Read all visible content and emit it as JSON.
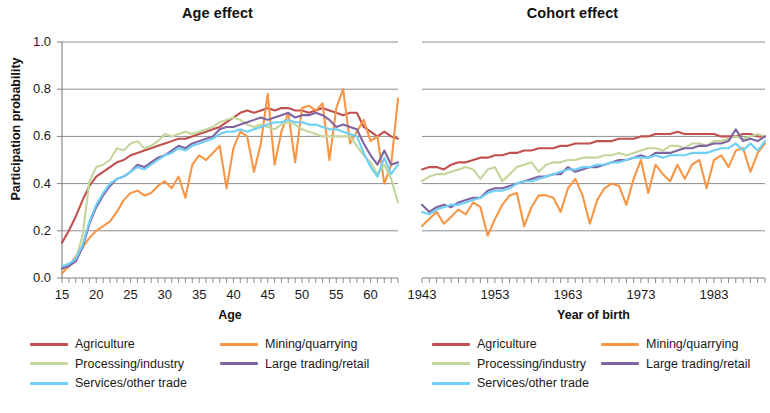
{
  "figure": {
    "panels": [
      "Age effect",
      "Cohort effect"
    ],
    "y_axis_label": "Participation probability"
  },
  "series_colors": {
    "Agriculture": "#c0504d",
    "Mining/quarrying": "#f79646",
    "Processing/industry": "#c3d69b",
    "Large trading/retail": "#8064a2",
    "Services/other trade": "#6ecff6"
  },
  "legend": {
    "items": [
      {
        "label": "Agriculture",
        "color": "#c0504d"
      },
      {
        "label": "Mining/quarrying",
        "color": "#f79646"
      },
      {
        "label": "Processing/industry",
        "color": "#c3d69b"
      },
      {
        "label": "Large trading/retail",
        "color": "#8064a2"
      },
      {
        "label": "Services/other trade",
        "color": "#6ecff6"
      }
    ]
  },
  "chart_data": [
    {
      "type": "line",
      "title": "Age effect",
      "xlabel": "Age",
      "ylabel": "Participation probability",
      "xlim": [
        15,
        64
      ],
      "ylim": [
        0.0,
        1.0
      ],
      "xticks": [
        15,
        20,
        25,
        30,
        35,
        40,
        45,
        50,
        55,
        60
      ],
      "yticks": [
        0.0,
        0.2,
        0.4,
        0.6,
        0.8,
        1.0
      ],
      "grid": "horizontal",
      "legend_position": "below",
      "x": [
        15,
        16,
        17,
        18,
        19,
        20,
        21,
        22,
        23,
        24,
        25,
        26,
        27,
        28,
        29,
        30,
        31,
        32,
        33,
        34,
        35,
        36,
        37,
        38,
        39,
        40,
        41,
        42,
        43,
        44,
        45,
        46,
        47,
        48,
        49,
        50,
        51,
        52,
        53,
        54,
        55,
        56,
        57,
        58,
        59,
        60,
        61,
        62,
        63,
        64
      ],
      "series": [
        {
          "name": "Agriculture",
          "color": "#c0504d",
          "values": [
            0.15,
            0.2,
            0.26,
            0.33,
            0.39,
            0.43,
            0.45,
            0.47,
            0.49,
            0.5,
            0.52,
            0.53,
            0.54,
            0.55,
            0.56,
            0.57,
            0.58,
            0.59,
            0.59,
            0.6,
            0.61,
            0.62,
            0.63,
            0.64,
            0.66,
            0.68,
            0.7,
            0.71,
            0.7,
            0.71,
            0.72,
            0.71,
            0.72,
            0.72,
            0.71,
            0.71,
            0.7,
            0.71,
            0.72,
            0.71,
            0.7,
            0.69,
            0.7,
            0.7,
            0.64,
            0.62,
            0.6,
            0.62,
            0.6,
            0.59
          ]
        },
        {
          "name": "Mining/quarrying",
          "color": "#f79646",
          "values": [
            0.02,
            0.05,
            0.09,
            0.13,
            0.17,
            0.2,
            0.22,
            0.24,
            0.28,
            0.33,
            0.36,
            0.37,
            0.35,
            0.36,
            0.39,
            0.41,
            0.38,
            0.43,
            0.34,
            0.48,
            0.52,
            0.5,
            0.53,
            0.56,
            0.38,
            0.55,
            0.62,
            0.6,
            0.45,
            0.57,
            0.78,
            0.48,
            0.62,
            0.7,
            0.49,
            0.72,
            0.73,
            0.71,
            0.74,
            0.5,
            0.72,
            0.8,
            0.57,
            0.62,
            0.67,
            0.58,
            0.6,
            0.4,
            0.48,
            0.76
          ]
        },
        {
          "name": "Processing/industry",
          "color": "#c3d69b",
          "values": [
            0.04,
            0.05,
            0.08,
            0.18,
            0.41,
            0.47,
            0.48,
            0.5,
            0.55,
            0.54,
            0.57,
            0.58,
            0.55,
            0.56,
            0.58,
            0.61,
            0.6,
            0.61,
            0.62,
            0.61,
            0.62,
            0.63,
            0.64,
            0.66,
            0.67,
            0.68,
            0.67,
            0.65,
            0.64,
            0.65,
            0.64,
            0.63,
            0.65,
            0.66,
            0.65,
            0.63,
            0.62,
            0.61,
            0.6,
            0.6,
            0.6,
            0.6,
            0.6,
            0.56,
            0.52,
            0.49,
            0.44,
            0.48,
            0.42,
            0.32
          ]
        },
        {
          "name": "Large trading/retail",
          "color": "#8064a2",
          "values": [
            0.04,
            0.05,
            0.07,
            0.13,
            0.23,
            0.3,
            0.35,
            0.39,
            0.42,
            0.43,
            0.45,
            0.48,
            0.47,
            0.49,
            0.51,
            0.52,
            0.54,
            0.56,
            0.55,
            0.57,
            0.58,
            0.59,
            0.6,
            0.63,
            0.64,
            0.64,
            0.65,
            0.66,
            0.67,
            0.68,
            0.67,
            0.68,
            0.69,
            0.7,
            0.68,
            0.69,
            0.69,
            0.7,
            0.69,
            0.67,
            0.64,
            0.65,
            0.64,
            0.63,
            0.57,
            0.52,
            0.48,
            0.54,
            0.48,
            0.49
          ]
        },
        {
          "name": "Services/other trade",
          "color": "#6ecff6",
          "values": [
            0.05,
            0.06,
            0.08,
            0.14,
            0.24,
            0.31,
            0.36,
            0.4,
            0.42,
            0.43,
            0.45,
            0.47,
            0.46,
            0.48,
            0.5,
            0.52,
            0.53,
            0.55,
            0.54,
            0.56,
            0.57,
            0.58,
            0.59,
            0.61,
            0.62,
            0.62,
            0.63,
            0.62,
            0.63,
            0.64,
            0.65,
            0.66,
            0.66,
            0.67,
            0.66,
            0.66,
            0.65,
            0.65,
            0.64,
            0.63,
            0.63,
            0.62,
            0.61,
            0.6,
            0.53,
            0.47,
            0.43,
            0.51,
            0.44,
            0.48
          ]
        }
      ]
    },
    {
      "type": "line",
      "title": "Cohort effect",
      "xlabel": "Year of birth",
      "ylabel": "Participation probability",
      "xlim": [
        1943,
        1990
      ],
      "ylim": [
        0.0,
        1.0
      ],
      "xticks": [
        1943,
        1953,
        1963,
        1973,
        1983
      ],
      "yticks": [
        0.0,
        0.2,
        0.4,
        0.6,
        0.8,
        1.0
      ],
      "grid": "horizontal",
      "legend_position": "below",
      "x": [
        1943,
        1944,
        1945,
        1946,
        1947,
        1948,
        1949,
        1950,
        1951,
        1952,
        1953,
        1954,
        1955,
        1956,
        1957,
        1958,
        1959,
        1960,
        1961,
        1962,
        1963,
        1964,
        1965,
        1966,
        1967,
        1968,
        1969,
        1970,
        1971,
        1972,
        1973,
        1974,
        1975,
        1976,
        1977,
        1978,
        1979,
        1980,
        1981,
        1982,
        1983,
        1984,
        1985,
        1986,
        1987,
        1988,
        1989,
        1990
      ],
      "series": [
        {
          "name": "Agriculture",
          "color": "#c0504d",
          "values": [
            0.46,
            0.47,
            0.47,
            0.46,
            0.48,
            0.49,
            0.49,
            0.5,
            0.51,
            0.51,
            0.52,
            0.52,
            0.53,
            0.53,
            0.54,
            0.54,
            0.55,
            0.55,
            0.55,
            0.56,
            0.56,
            0.57,
            0.57,
            0.57,
            0.58,
            0.58,
            0.58,
            0.59,
            0.59,
            0.59,
            0.6,
            0.6,
            0.61,
            0.61,
            0.61,
            0.62,
            0.61,
            0.61,
            0.61,
            0.61,
            0.61,
            0.6,
            0.6,
            0.6,
            0.61,
            0.61,
            0.6,
            0.6
          ]
        },
        {
          "name": "Mining/quarrying",
          "color": "#f79646",
          "values": [
            0.22,
            0.25,
            0.28,
            0.23,
            0.26,
            0.29,
            0.27,
            0.32,
            0.3,
            0.18,
            0.25,
            0.31,
            0.35,
            0.36,
            0.22,
            0.3,
            0.35,
            0.35,
            0.34,
            0.28,
            0.38,
            0.42,
            0.35,
            0.23,
            0.33,
            0.38,
            0.4,
            0.39,
            0.31,
            0.42,
            0.5,
            0.36,
            0.48,
            0.44,
            0.41,
            0.48,
            0.42,
            0.48,
            0.5,
            0.38,
            0.5,
            0.52,
            0.47,
            0.54,
            0.55,
            0.45,
            0.53,
            0.57
          ]
        },
        {
          "name": "Processing/industry",
          "color": "#c3d69b",
          "values": [
            0.41,
            0.43,
            0.44,
            0.44,
            0.45,
            0.46,
            0.47,
            0.46,
            0.42,
            0.46,
            0.47,
            0.41,
            0.44,
            0.47,
            0.48,
            0.49,
            0.45,
            0.48,
            0.49,
            0.49,
            0.5,
            0.5,
            0.51,
            0.51,
            0.51,
            0.52,
            0.52,
            0.53,
            0.52,
            0.53,
            0.54,
            0.55,
            0.55,
            0.54,
            0.56,
            0.56,
            0.55,
            0.57,
            0.57,
            0.56,
            0.58,
            0.58,
            0.59,
            0.6,
            0.59,
            0.6,
            0.61,
            0.6
          ]
        },
        {
          "name": "Large trading/retail",
          "color": "#8064a2",
          "values": [
            0.31,
            0.28,
            0.3,
            0.31,
            0.3,
            0.32,
            0.33,
            0.34,
            0.34,
            0.37,
            0.38,
            0.38,
            0.39,
            0.4,
            0.41,
            0.42,
            0.43,
            0.43,
            0.44,
            0.44,
            0.47,
            0.45,
            0.46,
            0.47,
            0.47,
            0.48,
            0.49,
            0.5,
            0.5,
            0.51,
            0.52,
            0.51,
            0.53,
            0.53,
            0.53,
            0.54,
            0.55,
            0.55,
            0.56,
            0.56,
            0.57,
            0.57,
            0.58,
            0.63,
            0.58,
            0.59,
            0.58,
            0.6
          ]
        },
        {
          "name": "Services/other trade",
          "color": "#6ecff6",
          "values": [
            0.28,
            0.27,
            0.29,
            0.3,
            0.31,
            0.31,
            0.32,
            0.33,
            0.34,
            0.36,
            0.37,
            0.37,
            0.38,
            0.4,
            0.41,
            0.41,
            0.42,
            0.43,
            0.44,
            0.45,
            0.46,
            0.46,
            0.47,
            0.47,
            0.48,
            0.48,
            0.49,
            0.49,
            0.5,
            0.51,
            0.51,
            0.51,
            0.52,
            0.51,
            0.52,
            0.52,
            0.52,
            0.53,
            0.53,
            0.53,
            0.54,
            0.55,
            0.55,
            0.57,
            0.54,
            0.57,
            0.54,
            0.58
          ]
        }
      ]
    }
  ]
}
